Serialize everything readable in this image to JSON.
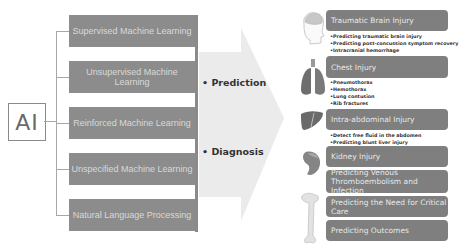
{
  "root": {
    "label": "AI"
  },
  "methods": [
    {
      "label": "Supervised Machine Learning"
    },
    {
      "label": "Unsupervised Machine Learning"
    },
    {
      "label": "Reinforced Machine Learning"
    },
    {
      "label": "Unspecified Machine Learning"
    },
    {
      "label": "Natural  Language Processing"
    }
  ],
  "arrow": {
    "items": [
      {
        "label": "• Prediction"
      },
      {
        "label": "• Diagnosis"
      }
    ]
  },
  "organs": [
    {
      "name": "head-brain-icon"
    },
    {
      "name": "lungs-icon"
    },
    {
      "name": "liver-icon"
    },
    {
      "name": "kidney-icon"
    },
    {
      "name": "femur-bone-icon"
    }
  ],
  "applications": [
    {
      "title": "Traumatic Brain Injury",
      "bullets": [
        "•Predicting traumatic brain injury",
        "•Predicting post-concussion symptom recovery",
        "•Intracranial hemorrhage"
      ]
    },
    {
      "title": "Chest Injury",
      "bullets": [
        "•Pneumothorax",
        "•Hemothorax",
        "•Lung contusion",
        "•Rib fractures"
      ]
    },
    {
      "title": "Intra-abdominal Injury",
      "bullets": [
        "•Detect free fluid in the abdomen",
        "•Predicting blunt liver injury"
      ]
    },
    {
      "title": "Kidney Injury",
      "bullets": []
    },
    {
      "title": "Predicting Venous Thromboembolism and Infection",
      "bullets": []
    },
    {
      "title": "Predicting the Need for Critical Care",
      "bullets": []
    },
    {
      "title": "Predicting Outcomes",
      "bullets": []
    }
  ],
  "colors": {
    "method_box": "#8c8c8c",
    "app_box": "#7f7f7f",
    "arrow": "#ebebeb",
    "text_dark": "#333333"
  }
}
